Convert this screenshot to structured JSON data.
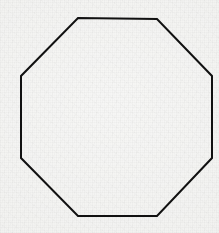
{
  "image": {
    "width": 219,
    "height": 233,
    "background_color": "#f1f1ef",
    "medium": "scanned-paper-grain",
    "description": "Line drawing of a regular octagon"
  },
  "figure": {
    "name": "octagon",
    "shape_type": "regular-octagon",
    "sides": 8,
    "fill": "none",
    "stroke_color": "#111111",
    "stroke_width": 2,
    "vertices": [
      [
        78,
        18
      ],
      [
        157,
        19
      ],
      [
        212,
        76
      ],
      [
        212,
        158
      ],
      [
        157,
        216
      ],
      [
        78,
        216
      ],
      [
        21,
        158
      ],
      [
        21,
        76
      ]
    ],
    "points_attr": "78,18 157,19 212,76 212,158 157,216 78,216 21,158 21,76",
    "bounding_box": {
      "x": 21,
      "y": 18,
      "width": 191,
      "height": 198
    },
    "center": [
      116,
      117
    ],
    "edges": [
      {
        "name": "top-edge",
        "from": [
          78,
          18
        ],
        "to": [
          157,
          19
        ],
        "orientation": "horizontal"
      },
      {
        "name": "upper-right-diagonal",
        "from": [
          157,
          19
        ],
        "to": [
          212,
          76
        ],
        "orientation": "diagonal"
      },
      {
        "name": "right-edge",
        "from": [
          212,
          76
        ],
        "to": [
          212,
          158
        ],
        "orientation": "vertical"
      },
      {
        "name": "lower-right-diagonal",
        "from": [
          212,
          158
        ],
        "to": [
          157,
          216
        ],
        "orientation": "diagonal"
      },
      {
        "name": "bottom-edge",
        "from": [
          157,
          216
        ],
        "to": [
          78,
          216
        ],
        "orientation": "horizontal"
      },
      {
        "name": "lower-left-diagonal",
        "from": [
          78,
          216
        ],
        "to": [
          21,
          158
        ],
        "orientation": "diagonal"
      },
      {
        "name": "left-edge",
        "from": [
          21,
          158
        ],
        "to": [
          21,
          76
        ],
        "orientation": "vertical"
      },
      {
        "name": "upper-left-diagonal",
        "from": [
          21,
          76
        ],
        "to": [
          78,
          18
        ],
        "orientation": "diagonal"
      }
    ]
  }
}
